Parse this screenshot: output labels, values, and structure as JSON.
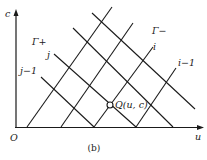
{
  "figure": {
    "caption": "(b)",
    "axes": {
      "x_label": "u",
      "y_label": "c",
      "origin_label": "O"
    },
    "characteristics": {
      "gamma_plus_label": "Γ+",
      "gamma_minus_label": "Γ−",
      "j_label": "j",
      "j_minus_1_label": "j−1",
      "i_label": "i",
      "i_minus_1_label": "i−1"
    },
    "point": {
      "name": "Q",
      "label": "Q(u, c)"
    }
  },
  "geometry": {
    "rising_lines": [
      {
        "x1": 27,
        "y1": 127,
        "x2": 112,
        "y2": 7
      },
      {
        "x1": 61,
        "y1": 127,
        "x2": 133,
        "y2": 23
      },
      {
        "x1": 94,
        "y1": 127,
        "x2": 153,
        "y2": 47
      },
      {
        "x1": 136,
        "y1": 127,
        "x2": 176,
        "y2": 68
      }
    ],
    "falling_lines": [
      {
        "x1": 41,
        "y1": 77,
        "x2": 94,
        "y2": 127
      },
      {
        "x1": 54,
        "y1": 54,
        "x2": 136,
        "y2": 127
      },
      {
        "x1": 73,
        "y1": 28,
        "x2": 173,
        "y2": 127
      },
      {
        "x1": 92,
        "y1": 13,
        "x2": 195,
        "y2": 109
      }
    ],
    "q_point": {
      "cx": 110,
      "cy": 105,
      "r": 3
    }
  }
}
